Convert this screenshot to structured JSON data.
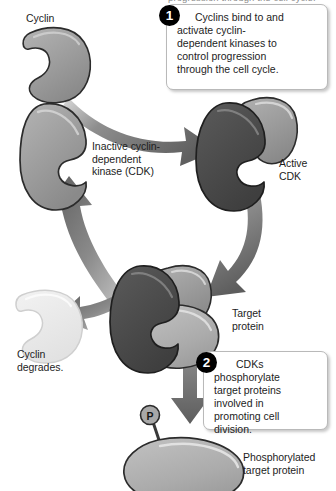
{
  "figure": {
    "clipped_header_text": "progression through the cell cycle.",
    "background": "#ffffff"
  },
  "palette": {
    "cyclin_fill": "#9b9b9b",
    "cyclin_faded_fill": "#e9e9e9",
    "cdk_inactive_fill": "#9a9a9a",
    "cdk_active_fill": "#4a4a4a",
    "target_protein_fill": "#b0b0b0",
    "arrow_fill": "#6e6e6e",
    "outline": "#2b2b2b",
    "text": "#1d1d1d",
    "callout_border": "#b9b9b9",
    "badge_bg": "#000000",
    "badge_text": "#ffffff"
  },
  "labels": {
    "cyclin": "Cyclin",
    "inactive_cdk": "Inactive cyclin-\ndependent\nkinase (CDK)",
    "active_cdk": "Active\nCDK",
    "cyclin_degrades": "Cyclin\ndegrades.",
    "target_protein": "Target\nprotein",
    "phosphorylated_target_protein": "Phosphorylated\ntarget protein",
    "phosphate_group": "P"
  },
  "callouts": [
    {
      "number": "1",
      "lines": [
        "Cyclins bind to and",
        "activate cyclin-",
        "dependent kinases to",
        "control progression",
        "through the cell cycle."
      ]
    },
    {
      "number": "2",
      "lines": [
        "CDKs",
        "phosphorylate",
        "target proteins",
        "involved in",
        "promoting cell",
        "division."
      ]
    }
  ],
  "shapes": [
    {
      "name": "cyclin-free",
      "role": "Cyclin",
      "tone": "medium"
    },
    {
      "name": "cdk-inactive",
      "role": "Inactive cyclin-dependent kinase (CDK)",
      "tone": "medium"
    },
    {
      "name": "cdk-active-complex",
      "role": "Active CDK bound to cyclin",
      "tone": "dark"
    },
    {
      "name": "cdk-cyclin-target-complex",
      "role": "Active CDK with cyclin and target protein",
      "tone": "dark"
    },
    {
      "name": "cyclin-degrading",
      "role": "Cyclin degrades",
      "tone": "faded"
    },
    {
      "name": "phosphorylated-target-protein",
      "role": "Phosphorylated target protein",
      "tone": "light"
    }
  ],
  "arrows": [
    {
      "name": "arrow-cyclin-to-active-cdk",
      "from": "Cyclin",
      "to": "Active CDK"
    },
    {
      "name": "arrow-active-cdk-to-target",
      "from": "Active CDK",
      "to": "Target protein complex"
    },
    {
      "name": "arrow-cycle-return-to-inactive-cdk",
      "from": "Complex",
      "to": "Inactive CDK"
    },
    {
      "name": "arrow-branch-to-cyclin-degrades",
      "from": "Complex",
      "to": "Cyclin degrades"
    },
    {
      "name": "arrow-phosphorylation-down",
      "from": "CDK complex",
      "to": "Phosphorylated target protein"
    }
  ]
}
